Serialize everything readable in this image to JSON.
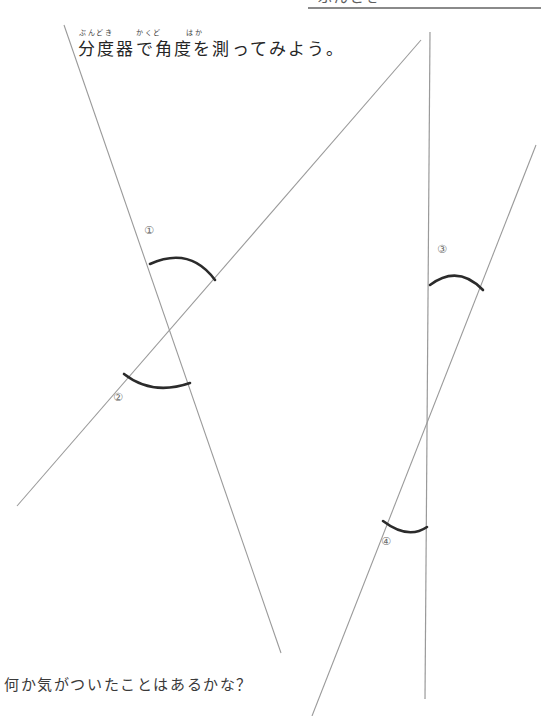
{
  "page": {
    "width": 541,
    "height": 716,
    "background": "#ffffff",
    "ink_color": "#8a8a8a",
    "arc_color": "#2b2b2b",
    "text_color": "#262626"
  },
  "top_strip": {
    "cropped_text": "ぶんどき",
    "note": "text row clipped at very top of page, only lower pixels visible",
    "rule_color": "#8a8a8a"
  },
  "heading": {
    "ruby_bundoki": "ぶんどき",
    "ruby_kakudo": "かくど",
    "ruby_haka": "はか",
    "main": "分度器で角度を測ってみよう。"
  },
  "footer": {
    "question": "何か気がついたことはあるかな？"
  },
  "angle_labels": {
    "one": "①",
    "two": "②",
    "three": "③",
    "four": "④"
  },
  "figure": {
    "lines": [
      {
        "name": "line-a-descending-left",
        "x1": 64,
        "y1": 25,
        "x2": 281,
        "y2": 653,
        "color": "#9a9a9a"
      },
      {
        "name": "line-b-ascending-left-to-right",
        "x1": 17,
        "y1": 506,
        "x2": 421,
        "y2": 40,
        "color": "#9a9a9a"
      },
      {
        "name": "line-c-vertical-right",
        "x1": 430,
        "y1": 32,
        "x2": 425,
        "y2": 699,
        "color": "#9a9a9a"
      },
      {
        "name": "line-d-steep-ascending-right",
        "x1": 312,
        "y1": 716,
        "x2": 536,
        "y2": 145,
        "color": "#9a9a9a"
      }
    ],
    "intersections": [
      {
        "name": "left-crossing",
        "x": 166,
        "y": 331
      },
      {
        "name": "right-crossing",
        "x": 429,
        "y": 412
      }
    ],
    "arcs": [
      {
        "name": "arc-angle-1",
        "label": "①",
        "path": "M 150 264 Q 190 246 215 280",
        "color": "#2b2b2b"
      },
      {
        "name": "arc-angle-2",
        "label": "②",
        "path": "M 124 374 Q 152 396 190 383",
        "color": "#2b2b2b"
      },
      {
        "name": "arc-angle-3",
        "label": "③",
        "path": "M 430 285 Q 458 264 483 290",
        "color": "#2b2b2b"
      },
      {
        "name": "arc-angle-4",
        "label": "④",
        "path": "M 383 521 Q 408 540 427 527",
        "color": "#2b2b2b"
      }
    ]
  }
}
